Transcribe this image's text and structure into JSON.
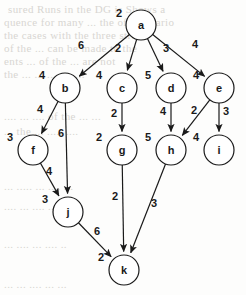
{
  "figure": {
    "type": "directed-acyclic-graph",
    "background_bleed_lines": [
      {
        "text": "sured  Runs    in the DG is Shows a",
        "x": 8,
        "y": 3
      },
      {
        "text": "quence for  many ...  the of CG vario",
        "x": 4,
        "y": 16
      },
      {
        "text": "the  cases  with  the  three   stru",
        "x": 4,
        "y": 29
      },
      {
        "text": "of the  ...  can  be  made  to  the",
        "x": 4,
        "y": 42
      },
      {
        "text": "ents   ...  of  the  ...  are   not",
        "x": 4,
        "y": 55
      },
      {
        "text": "the    ...  ...  ...   ...   ....",
        "x": 4,
        "y": 68
      },
      {
        "text": "....  ...  ....  of  the  ... ...",
        "x": 4,
        "y": 110
      },
      {
        "text": "...  the   ...   .....  ....",
        "x": 4,
        "y": 125
      },
      {
        "text": "...   .....   ...   ....  ...",
        "x": 4,
        "y": 180
      },
      {
        "text": "....  ...   ....   ...   ...",
        "x": 4,
        "y": 200
      },
      {
        "text": "...   ....   ...  ....  ..",
        "x": 4,
        "y": 238
      },
      {
        "text": "...   ...  ....   ...   ...",
        "x": 4,
        "y": 278
      }
    ],
    "node_radius": 15,
    "stroke_color": "#1a1a1a",
    "node_fill": "#ffffff",
    "nodes": [
      {
        "id": "a",
        "label": "a",
        "weight": "2",
        "cx": 141,
        "cy": 25,
        "weight_dx": -22,
        "weight_dy": -8
      },
      {
        "id": "b",
        "label": "b",
        "weight": "4",
        "cx": 65,
        "cy": 88,
        "weight_dx": -23,
        "weight_dy": -9
      },
      {
        "id": "c",
        "label": "c",
        "weight": "4",
        "cx": 122,
        "cy": 88,
        "weight_dx": -23,
        "weight_dy": -9
      },
      {
        "id": "d",
        "label": "d",
        "weight": "5",
        "cx": 171,
        "cy": 88,
        "weight_dx": -23,
        "weight_dy": -9
      },
      {
        "id": "e",
        "label": "e",
        "weight": "4",
        "cx": 219,
        "cy": 88,
        "weight_dx": -23,
        "weight_dy": -9
      },
      {
        "id": "f",
        "label": "f",
        "weight": "3",
        "cx": 33,
        "cy": 150,
        "weight_dx": -23,
        "weight_dy": -9
      },
      {
        "id": "g",
        "label": "g",
        "weight": "2",
        "cx": 122,
        "cy": 150,
        "weight_dx": -23,
        "weight_dy": -9
      },
      {
        "id": "h",
        "label": "h",
        "weight": "5",
        "cx": 171,
        "cy": 150,
        "weight_dx": -23,
        "weight_dy": -9
      },
      {
        "id": "i",
        "label": "i",
        "weight": "4",
        "cx": 219,
        "cy": 150,
        "weight_dx": -23,
        "weight_dy": -9
      },
      {
        "id": "j",
        "label": "j",
        "weight": "3",
        "cx": 68,
        "cy": 212,
        "weight_dx": -23,
        "weight_dy": -9
      },
      {
        "id": "k",
        "label": "k",
        "weight": "2",
        "cx": 124,
        "cy": 270,
        "weight_dx": -23,
        "weight_dy": -9
      }
    ],
    "edges": [
      {
        "from": "a",
        "to": "b",
        "weight": "6",
        "label_x": 81,
        "label_y": 49
      },
      {
        "from": "a",
        "to": "c",
        "weight": "2",
        "label_x": 118,
        "label_y": 52
      },
      {
        "from": "a",
        "to": "d",
        "weight": "3",
        "label_x": 166,
        "label_y": 52
      },
      {
        "from": "a",
        "to": "e",
        "weight": "4",
        "label_x": 195,
        "label_y": 48
      },
      {
        "from": "b",
        "to": "f",
        "weight": "4",
        "label_x": 40,
        "label_y": 113
      },
      {
        "from": "b",
        "to": "j",
        "weight": "6",
        "label_x": 61,
        "label_y": 137
      },
      {
        "from": "c",
        "to": "g",
        "weight": "2",
        "label_x": 114,
        "label_y": 117
      },
      {
        "from": "d",
        "to": "h",
        "weight": "4",
        "label_x": 163,
        "label_y": 115
      },
      {
        "from": "e",
        "to": "h",
        "weight": "2",
        "label_x": 194,
        "label_y": 114
      },
      {
        "from": "e",
        "to": "i",
        "weight": "3",
        "label_x": 226,
        "label_y": 115
      },
      {
        "from": "f",
        "to": "j",
        "weight": "4",
        "label_x": 49,
        "label_y": 175
      },
      {
        "from": "g",
        "to": "k",
        "weight": "2",
        "label_x": 115,
        "label_y": 200
      },
      {
        "from": "h",
        "to": "k",
        "weight": "3",
        "label_x": 154,
        "label_y": 207
      },
      {
        "from": "j",
        "to": "k",
        "weight": "6",
        "label_x": 97,
        "label_y": 235
      }
    ]
  }
}
